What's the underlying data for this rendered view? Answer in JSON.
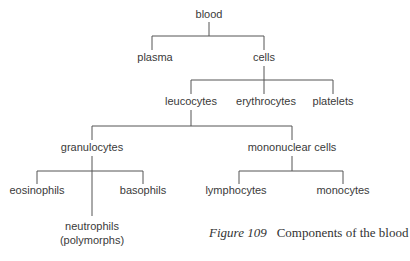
{
  "diagram": {
    "type": "tree",
    "nodes": {
      "blood": "blood",
      "plasma": "plasma",
      "cells": "cells",
      "leucocytes": "leucocytes",
      "erythrocytes": "erythrocytes",
      "platelets": "platelets",
      "granulocytes": "granulocytes",
      "mononuclear": "mononuclear cells",
      "eosinophils": "eosinophils",
      "neutrophils_line1": "neutrophils",
      "neutrophils_line2": "(polymorphs)",
      "basophils": "basophils",
      "lymphocytes": "lymphocytes",
      "monocytes": "monocytes"
    },
    "edges": [
      [
        "blood",
        "plasma"
      ],
      [
        "blood",
        "cells"
      ],
      [
        "cells",
        "leucocytes"
      ],
      [
        "cells",
        "erythrocytes"
      ],
      [
        "cells",
        "platelets"
      ],
      [
        "leucocytes",
        "granulocytes"
      ],
      [
        "leucocytes",
        "mononuclear cells"
      ],
      [
        "granulocytes",
        "eosinophils"
      ],
      [
        "granulocytes",
        "neutrophils (polymorphs)"
      ],
      [
        "granulocytes",
        "basophils"
      ],
      [
        "mononuclear cells",
        "lymphocytes"
      ],
      [
        "mononuclear cells",
        "monocytes"
      ]
    ]
  },
  "caption": {
    "figure_label": "Figure 109",
    "text": "Components of the blood"
  },
  "colors": {
    "text": "#3a3a3a",
    "lines": "#555555",
    "background": "#ffffff"
  }
}
